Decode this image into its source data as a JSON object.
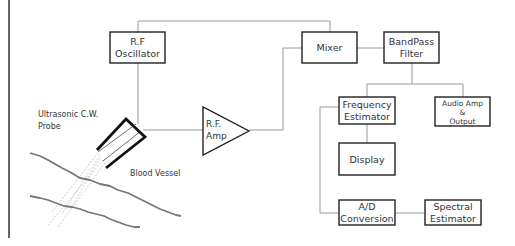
{
  "diagram": {
    "blocks": {
      "rf_oscillator": [
        "R.F",
        "Oscillator"
      ],
      "mixer": [
        "Mixer"
      ],
      "bandpass_filter": [
        "BandPass",
        "Filter"
      ],
      "frequency_estimator": [
        "Frequency",
        "Estimator"
      ],
      "audio_amp": [
        "Audio Amp",
        "&",
        "Output"
      ],
      "display": [
        "Display"
      ],
      "ad_conversion": [
        "A/D",
        "Conversion"
      ],
      "spectral_estimator": [
        "Spectral",
        "Estimator"
      ],
      "rf_amp": [
        "R.F.",
        "Amp"
      ]
    },
    "annotations": {
      "probe": [
        "Ultrasonic C.W.",
        "Probe"
      ],
      "vessel": "Blood Vessel"
    },
    "connections": [
      [
        "rf_oscillator",
        "mixer"
      ],
      [
        "rf_oscillator",
        "probe"
      ],
      [
        "probe",
        "rf_amp"
      ],
      [
        "rf_amp",
        "mixer"
      ],
      [
        "mixer",
        "bandpass_filter"
      ],
      [
        "bandpass_filter",
        "frequency_estimator"
      ],
      [
        "bandpass_filter",
        "audio_amp"
      ],
      [
        "frequency_estimator",
        "display"
      ],
      [
        "frequency_estimator",
        "ad_conversion"
      ],
      [
        "ad_conversion",
        "spectral_estimator"
      ]
    ]
  }
}
